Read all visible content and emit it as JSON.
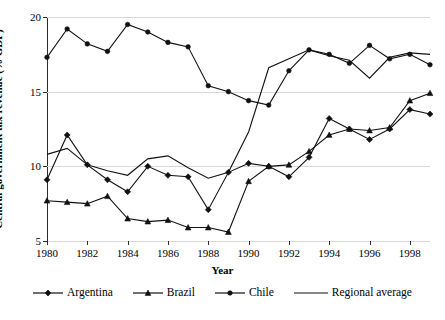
{
  "chart_data": {
    "type": "line",
    "title": "",
    "xlabel": "Year",
    "ylabel": "Central government tax revenue (% GDP)",
    "xlim": [
      1980,
      1999
    ],
    "ylim": [
      5,
      20
    ],
    "yticks": [
      5,
      10,
      15,
      20
    ],
    "ytick_labels": [
      "5",
      "10",
      "15",
      "20"
    ],
    "xticks": [
      1980,
      1982,
      1984,
      1986,
      1988,
      1990,
      1992,
      1994,
      1996,
      1998
    ],
    "xtick_labels": [
      "1980",
      "1982",
      "1984",
      "1986",
      "1988",
      "1990",
      "1992",
      "1994",
      "1996",
      "1998"
    ],
    "grid": true,
    "grid_axis": "y",
    "legend_position": "bottom",
    "x": [
      1980,
      1981,
      1982,
      1983,
      1984,
      1985,
      1986,
      1987,
      1988,
      1989,
      1990,
      1991,
      1992,
      1993,
      1994,
      1995,
      1996,
      1997,
      1998,
      1999
    ],
    "series": [
      {
        "name": "Argentina",
        "marker": "diamond",
        "color": "#111111",
        "values": [
          9.1,
          12.1,
          10.1,
          9.1,
          8.3,
          10.0,
          9.4,
          9.3,
          7.1,
          9.6,
          10.2,
          10.0,
          9.3,
          10.6,
          13.2,
          12.5,
          11.8,
          12.5,
          13.8,
          13.5
        ]
      },
      {
        "name": "Brazil",
        "marker": "triangle",
        "color": "#111111",
        "values": [
          7.7,
          7.6,
          7.5,
          8.0,
          6.5,
          6.3,
          6.4,
          5.9,
          5.9,
          5.6,
          9.0,
          10.0,
          10.1,
          11.0,
          12.1,
          12.5,
          12.4,
          12.6,
          14.4,
          14.9
        ]
      },
      {
        "name": "Chile",
        "marker": "circle",
        "color": "#111111",
        "values": [
          17.3,
          19.2,
          18.2,
          17.7,
          19.5,
          19.0,
          18.3,
          18.0,
          15.4,
          15.0,
          14.4,
          14.1,
          16.4,
          17.8,
          17.5,
          16.9,
          18.1,
          17.2,
          17.5,
          16.8
        ]
      },
      {
        "name": "Regional average",
        "marker": "none",
        "color": "#111111",
        "values": [
          10.8,
          11.2,
          10.1,
          9.7,
          9.4,
          10.5,
          10.7,
          9.9,
          9.2,
          9.6,
          12.3,
          16.6,
          17.2,
          17.8,
          17.4,
          17.1,
          15.9,
          17.3,
          17.6,
          17.5
        ]
      }
    ],
    "legend": [
      {
        "label": "Argentina",
        "marker": "diamond"
      },
      {
        "label": "Brazil",
        "marker": "triangle"
      },
      {
        "label": "Chile",
        "marker": "circle"
      },
      {
        "label": "Regional average",
        "marker": "none"
      }
    ]
  }
}
